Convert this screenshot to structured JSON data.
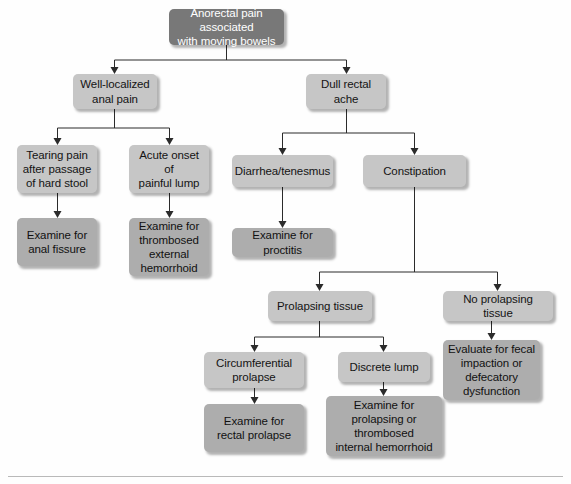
{
  "diagram": {
    "title": "Anorectal pain associated with moving bowels",
    "type": "flowchart",
    "colors": {
      "root_fill": "#787878",
      "root_text": "#ffffff",
      "level_fill": "#c6c6c6",
      "action_fill": "#adadad",
      "node_text": "#141414",
      "connector": "#2b2b2b",
      "background": "#fefefe",
      "rule": "#b9b9b9"
    },
    "nodes": [
      {
        "id": "root",
        "label": "Anorectal pain associated\nwith moving bowels",
        "kind": "root",
        "x": 169,
        "y": 9,
        "w": 115,
        "h": 36
      },
      {
        "id": "well_localized",
        "label": "Well-localized\nanal pain",
        "kind": "level",
        "x": 73,
        "y": 74,
        "w": 84,
        "h": 35
      },
      {
        "id": "dull_ache",
        "label": "Dull rectal\nache",
        "kind": "level",
        "x": 306,
        "y": 74,
        "w": 80,
        "h": 35
      },
      {
        "id": "tearing_pain",
        "label": "Tearing pain\nafter passage\nof hard stool",
        "kind": "level",
        "x": 17,
        "y": 145,
        "w": 80,
        "h": 48
      },
      {
        "id": "acute_lump",
        "label": "Acute onset of\npainful lump",
        "kind": "level",
        "x": 129,
        "y": 145,
        "w": 80,
        "h": 48
      },
      {
        "id": "diarrhea",
        "label": "Diarrhea/tenesmus",
        "kind": "level",
        "x": 232,
        "y": 155,
        "w": 101,
        "h": 32
      },
      {
        "id": "constipation",
        "label": "Constipation",
        "kind": "level",
        "x": 363,
        "y": 155,
        "w": 103,
        "h": 32
      },
      {
        "id": "exam_fissure",
        "label": "Examine for\nanal fissure",
        "kind": "action",
        "x": 17,
        "y": 218,
        "w": 80,
        "h": 48
      },
      {
        "id": "exam_thrombosed",
        "label": "Examine for\nthrombosed\nexternal\nhemorrhoid",
        "kind": "action",
        "x": 129,
        "y": 218,
        "w": 80,
        "h": 58
      },
      {
        "id": "exam_proctitis",
        "label": "Examine for proctitis",
        "kind": "action",
        "x": 232,
        "y": 228,
        "w": 101,
        "h": 29
      },
      {
        "id": "prolapsing",
        "label": "Prolapsing tissue",
        "kind": "level",
        "x": 268,
        "y": 291,
        "w": 104,
        "h": 30
      },
      {
        "id": "no_prolapsing",
        "label": "No prolapsing tissue",
        "kind": "level",
        "x": 443,
        "y": 291,
        "w": 110,
        "h": 30
      },
      {
        "id": "circumferential",
        "label": "Circumferential\nprolapse",
        "kind": "level",
        "x": 204,
        "y": 352,
        "w": 100,
        "h": 36
      },
      {
        "id": "discrete_lump",
        "label": "Discrete lump",
        "kind": "level",
        "x": 338,
        "y": 352,
        "w": 92,
        "h": 30
      },
      {
        "id": "evaluate_fecal",
        "label": "Evaluate for fecal\nimpaction or\ndefecatory\ndysfunction",
        "kind": "action",
        "x": 443,
        "y": 340,
        "w": 97,
        "h": 60
      },
      {
        "id": "exam_rectal",
        "label": "Examine for\nrectal prolapse",
        "kind": "action",
        "x": 204,
        "y": 404,
        "w": 100,
        "h": 48
      },
      {
        "id": "exam_internal",
        "label": "Examine for\nprolapsing or\nthrombosed\ninternal hemorrhoid",
        "kind": "action",
        "x": 326,
        "y": 396,
        "w": 116,
        "h": 60
      }
    ],
    "connectors": [
      "root-splits-to-well-localized-and-dull-ache",
      "well-localized-splits-to-tearing-pain-and-acute-lump",
      "dull-ache-splits-to-diarrhea-and-constipation",
      "tearing-pain-to-examine-anal-fissure",
      "acute-lump-to-examine-thrombosed-hemorrhoid",
      "diarrhea-to-examine-proctitis",
      "constipation-splits-to-prolapsing-and-no-prolapsing",
      "prolapsing-splits-to-circumferential-and-discrete-lump",
      "circumferential-to-examine-rectal-prolapse",
      "discrete-lump-to-examine-internal-hemorrhoid",
      "no-prolapsing-to-evaluate-fecal-impaction"
    ]
  }
}
